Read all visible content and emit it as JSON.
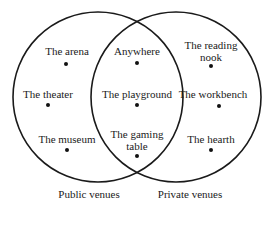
{
  "diagram": {
    "type": "venn",
    "sets": [
      {
        "id": "public",
        "label": "Public venues"
      },
      {
        "id": "private",
        "label": "Private venues"
      }
    ],
    "items": {
      "public_only": [
        {
          "label": "The arena"
        },
        {
          "label": "The theater"
        },
        {
          "label": "The museum"
        }
      ],
      "both": [
        {
          "label": "Anywhere"
        },
        {
          "label": "The playground"
        },
        {
          "label_line1": "The gaming",
          "label_line2": "table"
        }
      ],
      "private_only": [
        {
          "label_line1": "The reading",
          "label_line2": "nook"
        },
        {
          "label": "The workbench"
        },
        {
          "label": "The hearth"
        }
      ]
    },
    "colors": {
      "stroke": "#1a1a1a",
      "background": "#ffffff"
    }
  }
}
